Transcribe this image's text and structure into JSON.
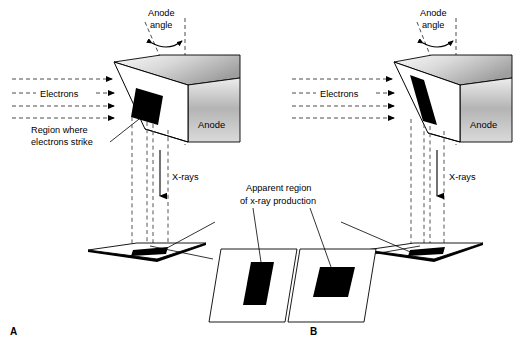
{
  "figure": {
    "background_color": "#ffffff",
    "ink_color": "#000000",
    "dash_color": "#4d4d4d"
  },
  "labels": {
    "anode_angle": {
      "line1": "Anode",
      "line2": "angle"
    },
    "electrons": "Electrons",
    "anode": "Anode",
    "region_strike": {
      "line1": "Region where",
      "line2": "electrons strike"
    },
    "xrays": "X-rays",
    "apparent_region": {
      "line1": "Apparent region",
      "line2": "of x-ray production"
    },
    "panel_a": "A",
    "panel_b": "B"
  },
  "panels": [
    {
      "id": "A",
      "letter": "A",
      "anode_label": "Anode",
      "electrons_label": "Electrons",
      "xrays_label": "X-rays",
      "anode_angle_label": "Anode angle",
      "anode_angle_description": "larger anode angle",
      "focal_spot_actual": "wide parallelogram on angled target face",
      "apparent_spot_shape": "tall narrow rectangle",
      "electron_beam_arrows": 4
    },
    {
      "id": "B",
      "letter": "B",
      "anode_label": "Anode",
      "electrons_label": "Electrons",
      "xrays_label": "X-rays",
      "anode_angle_label": "Anode angle",
      "anode_angle_description": "smaller / steeper anode angle",
      "focal_spot_actual": "narrow elongated parallelogram on steeper target face",
      "apparent_spot_shape": "square",
      "electron_beam_arrows": 4
    }
  ],
  "detail_callouts": [
    {
      "for_panel": "A",
      "caption": "Apparent region of x-ray production",
      "spot_shape": "tall narrow rectangle"
    },
    {
      "for_panel": "B",
      "caption": "Apparent region of x-ray production",
      "spot_shape": "square"
    }
  ],
  "colors": {
    "anode_gradient_top": "#ececec",
    "anode_gradient_mid": "#b8b8b8",
    "anode_gradient_bottom": "#d8d8d8",
    "anode_top_face_light": "#f2f2f2",
    "anode_top_face_dark": "#9c9c9c",
    "focal_spot": "#000000",
    "outline": "#000000"
  }
}
